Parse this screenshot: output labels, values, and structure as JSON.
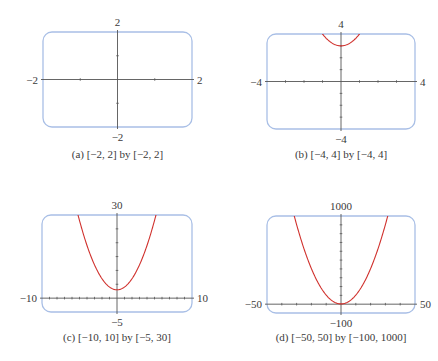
{
  "function": "y = x^2 + 3",
  "colors": {
    "frame": "#a9bfe6",
    "axis": "#555555",
    "curve": "#d0312d",
    "text": "#3a3a3a"
  },
  "panels": [
    {
      "id": "a",
      "caption": "(a) [−2, 2] by [−2, 2]",
      "xmin_label": "−2",
      "xmax_label": "2",
      "ymin_label": "−2",
      "ymax_label": "2"
    },
    {
      "id": "b",
      "caption": "(b) [−4, 4] by [−4, 4]",
      "xmin_label": "−4",
      "xmax_label": "4",
      "ymin_label": "−4",
      "ymax_label": "4"
    },
    {
      "id": "c",
      "caption": "(c) [−10, 10] by [−5, 30]",
      "xmin_label": "−10",
      "xmax_label": "10",
      "ymin_label": "−5",
      "ymax_label": "30"
    },
    {
      "id": "d",
      "caption": "(d) [−50, 50] by [−100, 1000]",
      "xmin_label": "−50",
      "xmax_label": "50",
      "ymin_label": "−100",
      "ymax_label": "1000"
    }
  ],
  "chart_data": [
    {
      "type": "line",
      "title": "(a) [-2, 2] by [-2, 2]",
      "function": "y = x^2 + 3",
      "xlim": [
        -2,
        2
      ],
      "ylim": [
        -2,
        2
      ],
      "xscale_tick": 1,
      "yscale_tick": 1,
      "curve_visible": false,
      "grid": false
    },
    {
      "type": "line",
      "title": "(b) [-4, 4] by [-4, 4]",
      "function": "y = x^2 + 3",
      "xlim": [
        -4,
        4
      ],
      "ylim": [
        -4,
        4
      ],
      "xscale_tick": 1,
      "yscale_tick": 1,
      "vertex": [
        0,
        3
      ],
      "curve_visible": true,
      "grid": false
    },
    {
      "type": "line",
      "title": "(c) [-10, 10] by [-5, 30]",
      "function": "y = x^2 + 3",
      "xlim": [
        -10,
        10
      ],
      "ylim": [
        -5,
        30
      ],
      "xscale_tick": 1,
      "yscale_tick": 5,
      "vertex": [
        0,
        3
      ],
      "curve_visible": true,
      "grid": false
    },
    {
      "type": "line",
      "title": "(d) [-50, 50] by [-100, 1000]",
      "function": "y = x^2 + 3",
      "xlim": [
        -50,
        50
      ],
      "ylim": [
        -100,
        1000
      ],
      "xscale_tick": 10,
      "yscale_tick": 100,
      "vertex": [
        0,
        3
      ],
      "curve_visible": true,
      "grid": false
    }
  ]
}
